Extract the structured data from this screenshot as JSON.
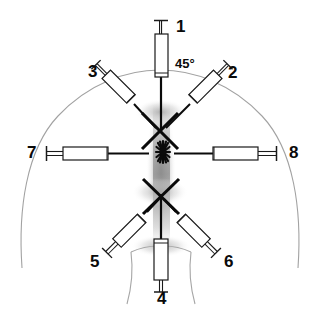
{
  "figure": {
    "background_color": "#ffffff",
    "ink_color": "#0a0a0a",
    "outline_color": "#9a9a9a",
    "shading_color": "#b4b4b4"
  },
  "annotations": {
    "angle": {
      "text": "45°",
      "x": 176,
      "y": 58
    }
  },
  "targets": [
    {
      "name": "upper-cross-mark",
      "symbol": "X",
      "cx": 160,
      "cy": 131
    },
    {
      "name": "central-starburst",
      "symbol": "*",
      "cx": 163,
      "cy": 152
    },
    {
      "name": "lower-cross-mark",
      "symbol": "X",
      "cx": 161,
      "cy": 196
    }
  ],
  "syringes": [
    {
      "id": "1",
      "label": "1",
      "label_x": 176,
      "label_y": 18,
      "orientation": "vertical-top",
      "angle_deg": 90,
      "approach": "midline from above",
      "barrel": {
        "x": 155,
        "y": 34,
        "w": 12,
        "h": 42
      },
      "plunger": {
        "x1": 161,
        "y1": 20,
        "x2": 161,
        "y2": 34
      },
      "flange": {
        "x1": 154,
        "y1": 20,
        "x2": 168,
        "y2": 20
      },
      "needle": {
        "x1": 161,
        "y1": 76,
        "x2": 161,
        "y2": 131
      }
    },
    {
      "id": "2",
      "label": "2",
      "label_x": 228,
      "label_y": 70,
      "orientation": "diagonal-upper-right",
      "angle_deg": 45,
      "approach": "right oblique 45° toward upper cross",
      "barrel": {
        "cx": 205,
        "cy": 87,
        "len": 34,
        "w": 11,
        "rot": 135
      },
      "plunger_tip": {
        "x": 224,
        "y": 66
      },
      "needle": {
        "x1": 187,
        "y1": 107,
        "x2": 164,
        "y2": 129
      }
    },
    {
      "id": "3",
      "label": "3",
      "label_x": 89,
      "label_y": 64,
      "orientation": "diagonal-upper-left",
      "angle_deg": 45,
      "approach": "left oblique 45° toward upper cross",
      "barrel": {
        "cx": 119,
        "cy": 88,
        "len": 34,
        "w": 11,
        "rot": 45
      },
      "plunger_tip": {
        "x": 101,
        "y": 66
      },
      "needle": {
        "x1": 137,
        "y1": 107,
        "x2": 158,
        "y2": 129
      }
    },
    {
      "id": "4",
      "label": "4",
      "label_x": 162,
      "label_y": 295,
      "orientation": "vertical-bottom",
      "angle_deg": 270,
      "approach": "midline from below",
      "barrel": {
        "x": 155,
        "y": 239,
        "w": 13,
        "h": 40
      },
      "plunger": {
        "x1": 161,
        "y1": 279,
        "x2": 161,
        "y2": 291
      },
      "flange": {
        "x1": 155,
        "y1": 291,
        "x2": 168,
        "y2": 291
      },
      "needle": {
        "x1": 161,
        "y1": 239,
        "x2": 161,
        "y2": 198
      }
    },
    {
      "id": "5",
      "label": "5",
      "label_x": 93,
      "label_y": 257,
      "orientation": "diagonal-lower-left",
      "angle_deg": 45,
      "approach": "left oblique from below toward lower cross",
      "barrel": {
        "cx": 129,
        "cy": 231,
        "len": 36,
        "w": 11,
        "rot": 135
      },
      "plunger_tip": {
        "x": 109,
        "y": 252
      },
      "needle": {
        "x1": 147,
        "y1": 212,
        "x2": 158,
        "y2": 200
      }
    },
    {
      "id": "6",
      "label": "6",
      "label_x": 224,
      "label_y": 257,
      "orientation": "diagonal-lower-right",
      "angle_deg": 45,
      "approach": "right oblique from below toward lower cross",
      "barrel": {
        "cx": 194,
        "cy": 231,
        "len": 36,
        "w": 11,
        "rot": 45
      },
      "plunger_tip": {
        "x": 214,
        "y": 252
      },
      "needle": {
        "x1": 176,
        "y1": 212,
        "x2": 165,
        "y2": 200
      }
    },
    {
      "id": "7",
      "label": "7",
      "label_x": 28,
      "label_y": 146,
      "orientation": "horizontal-left",
      "angle_deg": 0,
      "approach": "lateral from the left",
      "barrel": {
        "x": 63,
        "y": 147,
        "w": 45,
        "h": 13
      },
      "plunger": {
        "x1": 47,
        "y1": 153,
        "x2": 63,
        "y2": 153
      },
      "flange": {
        "x1": 47,
        "y1": 147,
        "x2": 47,
        "y2": 160
      },
      "needle": {
        "x1": 108,
        "y1": 153,
        "x2": 148,
        "y2": 153
      }
    },
    {
      "id": "8",
      "label": "8",
      "label_x": 290,
      "label_y": 146,
      "orientation": "horizontal-right",
      "angle_deg": 180,
      "approach": "lateral from the right",
      "barrel": {
        "x": 213,
        "y": 147,
        "w": 45,
        "h": 13
      },
      "plunger": {
        "x1": 258,
        "y1": 153,
        "x2": 275,
        "y2": 153
      },
      "flange": {
        "x1": 275,
        "y1": 147,
        "x2": 275,
        "y2": 160
      },
      "needle": {
        "x1": 213,
        "y1": 153,
        "x2": 175,
        "y2": 153
      }
    }
  ],
  "anatomy": {
    "body_outline_name": "head-neck-dome-outline",
    "midline_name": "midline-shading-column",
    "neck_base_name": "neck-base-v-lines"
  }
}
